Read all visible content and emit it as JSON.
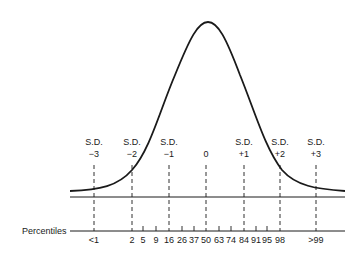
{
  "diagram": {
    "type": "normal-distribution-curve",
    "axis_label": "Percentiles",
    "sd_markers": [
      {
        "label_top": "S.D.",
        "label_bottom": "−3",
        "x": 94
      },
      {
        "label_top": "S.D.",
        "label_bottom": "−2",
        "x": 132
      },
      {
        "label_top": "S.D.",
        "label_bottom": "−1",
        "x": 169
      },
      {
        "label_top": "",
        "label_bottom": "0",
        "x": 206
      },
      {
        "label_top": "S.D.",
        "label_bottom": "+1",
        "x": 244
      },
      {
        "label_top": "S.D.",
        "label_bottom": "+2",
        "x": 280
      },
      {
        "label_top": "S.D.",
        "label_bottom": "+3",
        "x": 316
      }
    ],
    "percentile_ticks": [
      {
        "label": "<1",
        "x": 94,
        "major": true
      },
      {
        "label": "2",
        "x": 132,
        "major": true
      },
      {
        "label": "5",
        "x": 143,
        "major": false
      },
      {
        "label": "9",
        "x": 156,
        "major": false
      },
      {
        "label": "16",
        "x": 169,
        "major": true
      },
      {
        "label": "26",
        "x": 182,
        "major": false
      },
      {
        "label": "37",
        "x": 194,
        "major": false
      },
      {
        "label": "50",
        "x": 206,
        "major": true
      },
      {
        "label": "63",
        "x": 219,
        "major": false
      },
      {
        "label": "74",
        "x": 231,
        "major": false
      },
      {
        "label": "84",
        "x": 244,
        "major": true
      },
      {
        "label": "91",
        "x": 256,
        "major": false
      },
      {
        "label": "95",
        "x": 267,
        "major": false
      },
      {
        "label": "98",
        "x": 280,
        "major": true
      },
      {
        "label": ">99",
        "x": 316,
        "major": true
      }
    ],
    "colors": {
      "line": "#1a1a1a",
      "background": "#ffffff"
    }
  }
}
